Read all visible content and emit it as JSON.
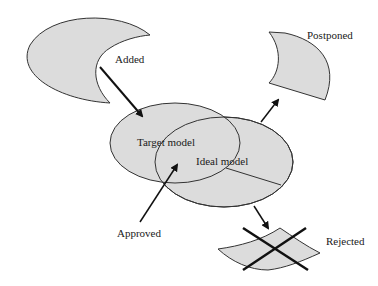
{
  "diagram": {
    "title": "",
    "labels": {
      "added": "Added",
      "target_model": "Target model",
      "ideal_model": "Ideal model",
      "approved": "Approved",
      "postponed": "Postponed",
      "rejected": "Rejected"
    },
    "nodes": [
      {
        "id": "added",
        "shape": "crescent",
        "label": "Added"
      },
      {
        "id": "target_model",
        "shape": "ellipse",
        "label": "Target model"
      },
      {
        "id": "ideal_model",
        "shape": "ellipse",
        "label": "Ideal model"
      },
      {
        "id": "postponed",
        "shape": "curved-quad",
        "label": "Postponed"
      },
      {
        "id": "rejected",
        "shape": "curved-wedge-crossed",
        "label": "Rejected"
      }
    ],
    "edges": [
      {
        "from": "added",
        "to": "target_model"
      },
      {
        "from": "approved",
        "to": "target_model/ideal_model overlap"
      },
      {
        "from": "ideal_model",
        "to": "postponed"
      },
      {
        "from": "ideal_model",
        "to": "rejected"
      }
    ],
    "colors": {
      "fill": "#dcdcdc",
      "stroke": "#2a2a2a",
      "background": "#ffffff"
    }
  }
}
